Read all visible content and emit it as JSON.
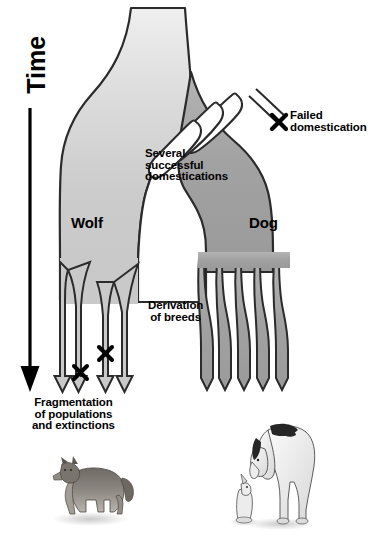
{
  "figure": {
    "background_color": "#ffffff",
    "outline_color": "#2b2b2b",
    "wolf_fill_color": "#c9c9c9",
    "dog_fill_color": "#9e9e9e",
    "trunk_top_color": "#ededed",
    "axis": {
      "name": "time-axis",
      "label": "Time",
      "direction": "downward",
      "arrow_color": "#000000"
    },
    "labels": {
      "time": "Time",
      "wolf": "Wolf",
      "dog": "Dog",
      "failed_domestication": "Failed\ndomestication",
      "several_successful_domestications": "Several\nsuccessful\ndomestications",
      "derivation_of_breeds": "Derivation\nof breeds",
      "fragmentation": "Fragmentation\nof populations\nand extinctions"
    },
    "markers": {
      "x_marker_glyph": "x",
      "failed_domestication_count": 1,
      "extinction_count": 2
    },
    "branches": {
      "wolf_lineage_prongs": 4,
      "dog_breed_prongs": 5,
      "domestication_loops": 3
    },
    "illustrations": [
      {
        "name": "wolf-photo",
        "caption": "Grey wolf standing in profile"
      },
      {
        "name": "dogs-photo",
        "caption": "Great Dane looking down at a small dog"
      }
    ]
  }
}
